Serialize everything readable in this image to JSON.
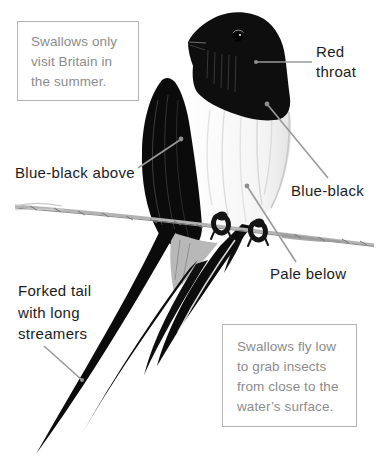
{
  "diagram": {
    "subject": "swallow"
  },
  "callouts": {
    "summer_box": {
      "text": "Swallows only visit Britain in the summer.",
      "lines": [
        "Swallows only",
        "visit Britain in",
        "the summer."
      ]
    },
    "flight_box": {
      "text": "Swallows fly low to grab insects from close to the water's surface.",
      "lines": [
        "Swallows fly low",
        "to grab insects",
        "from close to the",
        "water’s surface."
      ]
    }
  },
  "labels": {
    "red_throat": {
      "text": "Red throat",
      "lines": [
        "Red",
        "throat"
      ]
    },
    "blue_black_above": {
      "text": "Blue-black above"
    },
    "blue_black": {
      "text": "Blue-black"
    },
    "pale_below": {
      "text": "Pale below"
    },
    "forked_tail": {
      "text": "Forked tail with long streamers",
      "lines": [
        "Forked tail",
        "with long",
        "streamers"
      ]
    }
  },
  "colors": {
    "background": "#ffffff",
    "label_text": "#1b1b1b",
    "box_text": "#8c8c8c",
    "box_border": "#b3b3b3",
    "pointer_line": "#9a9a9a",
    "pointer_dot": "#8f8f8f",
    "bird_dark": "#0d0d0d",
    "wire_gray": "#b3b3b3"
  }
}
